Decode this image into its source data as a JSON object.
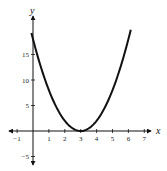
{
  "chart_data": {
    "type": "line",
    "title": "",
    "xlabel": "x",
    "ylabel": "y",
    "function": "y = 2(x - 3)^2",
    "xlim": [
      -1.5,
      7.5
    ],
    "ylim": [
      -7,
      22
    ],
    "x_ticks": [
      -1,
      1,
      2,
      3,
      4,
      5,
      6,
      7
    ],
    "y_ticks": [
      -5,
      5,
      10,
      15
    ],
    "grid": false,
    "series": [
      {
        "name": "parabola",
        "x": [
          0,
          0.5,
          1,
          1.5,
          2,
          2.5,
          3,
          3.5,
          4,
          4.5,
          5,
          5.5,
          6,
          6.1
        ],
        "values": [
          18,
          12.5,
          8,
          4.5,
          2,
          0.5,
          0,
          0.5,
          2,
          4.5,
          8,
          12.5,
          18,
          19.2
        ]
      }
    ],
    "vertex": [
      3,
      0
    ]
  },
  "labels": {
    "x_axis": "x",
    "y_axis": "y",
    "xticks": [
      "-1",
      "1",
      "2",
      "3",
      "4",
      "5",
      "6",
      "7"
    ],
    "yticks": [
      "-5",
      "5",
      "10",
      "15"
    ]
  }
}
